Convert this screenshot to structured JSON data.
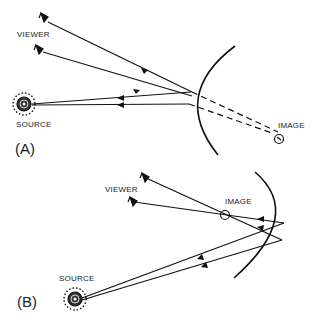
{
  "panel_a": {
    "label": "(A)",
    "viewer_label": "VIEWER",
    "source_label": "SOURCE",
    "image_label": "IMAGE",
    "mirror_type": "convex"
  },
  "panel_b": {
    "label": "(B)",
    "viewer_label": "VIEWER",
    "source_label": "SOURCE",
    "image_label": "IMAGE",
    "mirror_type": "concave"
  }
}
